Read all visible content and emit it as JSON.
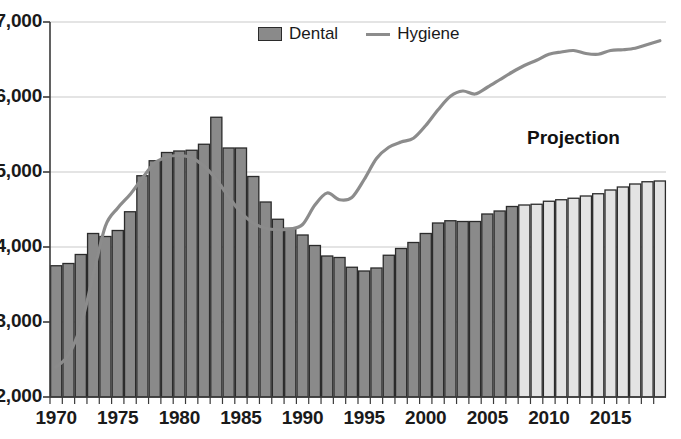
{
  "chart_data": {
    "type": "bar",
    "title": "",
    "xlabel": "",
    "ylabel": "",
    "ylim": [
      2000,
      7000
    ],
    "xlim": [
      1970,
      2019
    ],
    "grid": true,
    "legend_position": "top-center",
    "y_ticks": [
      "2,000",
      "3,000",
      "4,000",
      "5,000",
      "6,000",
      "7,000"
    ],
    "y_tick_values": [
      2000,
      3000,
      4000,
      5000,
      6000,
      7000
    ],
    "x_ticks": [
      "1970",
      "1975",
      "1980",
      "1985",
      "1990",
      "1995",
      "2000",
      "2005",
      "2010",
      "2015"
    ],
    "x_tick_values": [
      1970,
      1975,
      1980,
      1985,
      1990,
      1995,
      2000,
      2005,
      2010,
      2015
    ],
    "categories": [
      1970,
      1971,
      1972,
      1973,
      1974,
      1975,
      1976,
      1977,
      1978,
      1979,
      1980,
      1981,
      1982,
      1983,
      1984,
      1985,
      1986,
      1987,
      1988,
      1989,
      1990,
      1991,
      1992,
      1993,
      1994,
      1995,
      1996,
      1997,
      1998,
      1999,
      2000,
      2001,
      2002,
      2003,
      2004,
      2005,
      2006,
      2007,
      2008,
      2009,
      2010,
      2011,
      2012,
      2013,
      2014,
      2015,
      2016,
      2017,
      2018,
      2019
    ],
    "series": [
      {
        "name": "Dental",
        "type": "bar",
        "values": [
          3750,
          3780,
          3900,
          4180,
          4140,
          4220,
          4470,
          4950,
          5150,
          5260,
          5280,
          5290,
          5370,
          5730,
          5320,
          5320,
          4940,
          4600,
          4370,
          4250,
          4160,
          4020,
          3880,
          3860,
          3730,
          3680,
          3720,
          3890,
          3980,
          4060,
          4180,
          4320,
          4350,
          4340,
          4340,
          4440,
          4480,
          4540,
          4560,
          4570,
          4610,
          4630,
          4650,
          4680,
          4710,
          4760,
          4800,
          4840,
          4870,
          4880
        ],
        "projection_start_year": 2008,
        "colors": {
          "actual_fill": "#8a8a8a",
          "projection_fill": "#e3e3e3",
          "edge": "#2b2b2b"
        }
      },
      {
        "name": "Hygiene",
        "type": "line",
        "values": [
          2400,
          2560,
          2950,
          3620,
          4280,
          4520,
          4700,
          4920,
          5120,
          5200,
          5220,
          5190,
          5080,
          4900,
          4670,
          4460,
          4320,
          4250,
          4230,
          4240,
          4300,
          4560,
          4720,
          4630,
          4660,
          4900,
          5180,
          5330,
          5400,
          5450,
          5620,
          5830,
          6010,
          6080,
          6040,
          6130,
          6230,
          6330,
          6420,
          6490,
          6570,
          6600,
          6620,
          6580,
          6570,
          6620,
          6630,
          6650,
          6700,
          6750
        ],
        "colors": {
          "line": "#8c8c8c"
        }
      }
    ],
    "annotations": [
      {
        "name": "projection-label",
        "text": "Projection",
        "x": 2011,
        "y": 5900
      }
    ],
    "legend": [
      {
        "label": "Dental",
        "marker": "bar-swatch-icon"
      },
      {
        "label": "Hygiene",
        "marker": "line-swatch-icon"
      }
    ]
  }
}
